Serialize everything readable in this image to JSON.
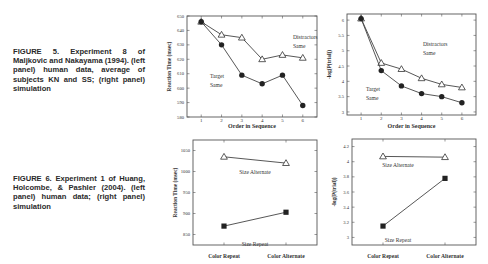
{
  "captions": {
    "fig5": "FIGURE 5. Experiment 8 of Maljkovic and Nakayama (1994). (left panel) human data, average of subjects KN and SS; (right panel) simulation",
    "fig6": "FIGURE 6. Experiment 1 of Huang, Holcombe, & Pashler (2004). (left panel) human data; (right panel) simulation"
  },
  "chart_data": [
    {
      "id": "fig5-left",
      "type": "line",
      "title": "",
      "xlabel": "Order in Sequence",
      "ylabel": "Reaction Time (msec)",
      "x": [
        1,
        2,
        3,
        4,
        5,
        6
      ],
      "ylim": [
        580,
        650
      ],
      "yticks": [
        580,
        590,
        600,
        610,
        620,
        630,
        640,
        650
      ],
      "grid": false,
      "series": [
        {
          "name": "Distractors Same",
          "marker": "open-triangle",
          "values": [
            646,
            637,
            635,
            620,
            623,
            621
          ]
        },
        {
          "name": "Target Same",
          "marker": "filled-circle",
          "values": [
            646,
            630,
            609,
            603,
            609,
            588
          ]
        }
      ],
      "annotations": [
        "Distractors Same",
        "Target Same"
      ]
    },
    {
      "id": "fig5-right",
      "type": "line",
      "title": "",
      "xlabel": "Order in Sequence",
      "ylabel": "-log(P(trial))",
      "x": [
        1,
        2,
        3,
        4,
        5,
        6
      ],
      "ylim": [
        2.9,
        6.2
      ],
      "yticks": [
        3,
        3.5,
        4,
        4.5,
        5,
        5.5,
        6
      ],
      "grid": false,
      "series": [
        {
          "name": "Distractors Same",
          "marker": "open-triangle",
          "values": [
            6.05,
            4.6,
            4.4,
            4.1,
            3.9,
            3.8
          ]
        },
        {
          "name": "Target Same",
          "marker": "filled-circle",
          "values": [
            6.05,
            4.35,
            3.85,
            3.6,
            3.5,
            3.3
          ]
        }
      ],
      "annotations": [
        "Distractors Same",
        "Target Same"
      ]
    },
    {
      "id": "fig6-left",
      "type": "line",
      "title": "",
      "xlabel": "",
      "ylabel": "Reaction Time (msec)",
      "categories": [
        "Color Repeat",
        "Color Alternate"
      ],
      "ylim": [
        825,
        1075
      ],
      "yticks": [
        850,
        900,
        950,
        1000,
        1050
      ],
      "grid": false,
      "series": [
        {
          "name": "Size Alternate",
          "marker": "open-triangle",
          "values": [
            1035,
            1020
          ]
        },
        {
          "name": "Size Repeat",
          "marker": "filled-square",
          "values": [
            870,
            903
          ]
        }
      ],
      "annotations": [
        "Size Alternate",
        "Size Repeat"
      ]
    },
    {
      "id": "fig6-right",
      "type": "line",
      "title": "",
      "xlabel": "",
      "ylabel": "-log(P(trial))",
      "categories": [
        "Color Repeat",
        "Color Alternate"
      ],
      "ylim": [
        2.9,
        4.3
      ],
      "yticks": [
        3,
        3.2,
        3.4,
        3.6,
        3.8,
        4,
        4.2
      ],
      "grid": false,
      "series": [
        {
          "name": "Size Alternate",
          "marker": "open-triangle",
          "values": [
            4.07,
            4.06
          ]
        },
        {
          "name": "Size Repeat",
          "marker": "filled-square",
          "values": [
            3.15,
            3.78
          ]
        }
      ],
      "annotations": [
        "Size Alternate",
        "Size Repeat"
      ]
    }
  ]
}
